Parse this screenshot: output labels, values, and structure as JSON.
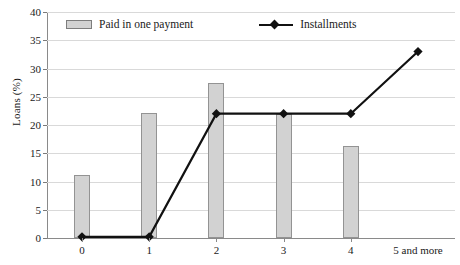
{
  "chart_data": {
    "type": "bar",
    "title": "",
    "xlabel": "",
    "ylabel": "Loans (%)",
    "categories": [
      "0",
      "1",
      "2",
      "3",
      "4",
      "5 and more"
    ],
    "ylim": [
      0,
      40
    ],
    "yticks": [
      0,
      5,
      10,
      15,
      20,
      25,
      30,
      35,
      40
    ],
    "grid": true,
    "legend_position": "top-inside",
    "series": [
      {
        "name": "Paid in one payment",
        "type": "bar",
        "color": "#d2d2d2",
        "values": [
          11.1,
          22.1,
          27.5,
          22.0,
          16.3,
          0
        ]
      },
      {
        "name": "Installments",
        "type": "line",
        "color": "#111111",
        "marker": "diamond",
        "values": [
          0.2,
          0.2,
          22.0,
          22.0,
          22.0,
          33.0
        ]
      }
    ]
  },
  "axes": {
    "ylabel": "Loans (%)",
    "ytick_labels": [
      "0",
      "5",
      "10",
      "15",
      "20",
      "25",
      "30",
      "35",
      "40"
    ],
    "xtick_labels": [
      "0",
      "1",
      "2",
      "3",
      "4",
      "5 and more"
    ]
  },
  "legend": {
    "bar_label": "Paid in one payment",
    "line_label": "Installments"
  },
  "colors": {
    "bar_fill": "#d2d2d2",
    "bar_stroke": "#939393",
    "line": "#111111",
    "grid": "#d9d9d9",
    "axis": "#8a8a8a",
    "text": "#1a1a1a"
  }
}
